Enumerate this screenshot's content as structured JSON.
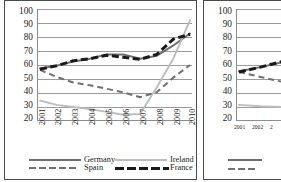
{
  "figure": {
    "panels": [
      "left-chart",
      "right-chart-cropped"
    ],
    "background": "#ffffff",
    "border_color": "#4a4a4a"
  },
  "colors": {
    "germany": "#6e6e6e",
    "spain": "#707070",
    "ireland": "#bdbdbd",
    "france": "#1a1a1a",
    "grid": "#9b9b9b",
    "axis": "#8d8d8d",
    "text": "#1c1c1c"
  },
  "chart_data": [
    {
      "id": "left-chart",
      "type": "line",
      "title": "",
      "xlabel": "",
      "ylabel": "",
      "ylim": [
        20,
        100
      ],
      "yticks": [
        100,
        90,
        80,
        70,
        60,
        50,
        40,
        30,
        20
      ],
      "grid": true,
      "legend_position": "bottom",
      "x": [
        "2001",
        "2002",
        "2003",
        "2004",
        "2005",
        "2006",
        "2007",
        "2008",
        "2009",
        "2010"
      ],
      "series": [
        {
          "name": "Germany",
          "style": "solid",
          "color": "#6e6e6e",
          "values": [
            57.5,
            59.5,
            62.5,
            64.5,
            67.5,
            67.5,
            64.5,
            66.5,
            74.0,
            82.5
          ]
        },
        {
          "name": "Spain",
          "style": "dashed",
          "color": "#707070",
          "values": [
            56.5,
            51.5,
            47.5,
            45.5,
            43.0,
            40.5,
            37.0,
            40.5,
            51.0,
            60.0
          ]
        },
        {
          "name": "Ireland",
          "style": "solid",
          "color": "#bdbdbd",
          "values": [
            34.5,
            31.5,
            30.0,
            28.5,
            26.5,
            24.5,
            25.0,
            44.0,
            64.5,
            92.0
          ]
        },
        {
          "name": "France",
          "style": "dashed-heavy",
          "color": "#1a1a1a",
          "values": [
            57.0,
            59.5,
            63.0,
            64.5,
            67.0,
            65.5,
            64.0,
            67.5,
            78.5,
            82.0
          ]
        }
      ]
    },
    {
      "id": "right-chart-cropped",
      "type": "line",
      "title": "",
      "xlabel": "",
      "ylabel": "",
      "ylim": [
        20,
        100
      ],
      "yticks": [
        100,
        90,
        80,
        70,
        60,
        50,
        40,
        30,
        20
      ],
      "grid": true,
      "legend_position": "bottom",
      "cropped": true,
      "x": [
        "2001",
        "2002",
        "2003"
      ],
      "series": [
        {
          "name": "Germany",
          "style": "solid",
          "color": "#6e6e6e",
          "values": [
            55.5,
            58.5,
            62.0
          ]
        },
        {
          "name": "Spain",
          "style": "dashed",
          "color": "#707070",
          "values": [
            55.0,
            51.5,
            48.0
          ]
        },
        {
          "name": "Ireland",
          "style": "solid",
          "color": "#bdbdbd",
          "values": [
            31.5,
            30.5,
            30.0
          ]
        },
        {
          "name": "France",
          "style": "dashed-heavy",
          "color": "#1a1a1a",
          "values": [
            55.0,
            58.5,
            62.5
          ]
        }
      ]
    }
  ],
  "left_panel": {
    "yticks": [
      "100",
      "90",
      "80",
      "70",
      "60",
      "50",
      "40",
      "30",
      "20"
    ],
    "xticks": [
      "2001",
      "2002",
      "2003",
      "2004",
      "2005",
      "2006",
      "2007",
      "2008",
      "2009",
      "2010"
    ],
    "legend": {
      "column1": [
        {
          "label": "Germany",
          "swatch": "solid-gray"
        },
        {
          "label": "Spain",
          "swatch": "dashed-gray"
        }
      ],
      "column2": [
        {
          "label": "Ireland",
          "swatch": "solid-lightgray"
        },
        {
          "label": "France",
          "swatch": "dashed-black"
        }
      ]
    }
  },
  "right_panel": {
    "yticks": [
      "100",
      "90",
      "80",
      "70",
      "60",
      "50",
      "40",
      "30",
      "20"
    ],
    "xticks": [
      "2001",
      "2002",
      "2"
    ],
    "legend": {
      "column1": [
        {
          "label": "",
          "swatch": "solid-gray"
        },
        {
          "label": "",
          "swatch": "dashed-gray"
        }
      ]
    }
  }
}
